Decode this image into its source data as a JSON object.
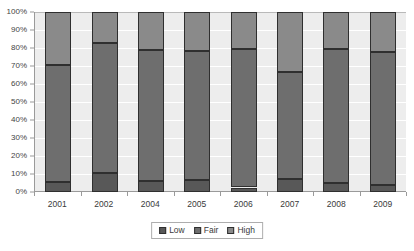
{
  "header": {
    "faint_text": "",
    "page_marker": ""
  },
  "chart_data": {
    "type": "bar",
    "subtype": "stacked-percent-column",
    "title": "",
    "xlabel": "",
    "ylabel": "",
    "categories": [
      "2001",
      "2002",
      "2004",
      "2005",
      "2006",
      "2007",
      "2008",
      "2009"
    ],
    "series": [
      {
        "name": "Low",
        "color": "#585858",
        "values": [
          5.3,
          10.5,
          6.3,
          6.5,
          2.5,
          7.0,
          4.8,
          4.0
        ]
      },
      {
        "name": "Fair",
        "color": "#6e6e6e",
        "values": [
          65.4,
          72.5,
          72.5,
          72.0,
          77.0,
          59.8,
          74.7,
          74.0
        ]
      },
      {
        "name": "High",
        "color": "#8a8a8a",
        "values": [
          29.3,
          17.0,
          21.2,
          21.5,
          20.5,
          33.2,
          20.5,
          22.0
        ]
      }
    ],
    "cumulative_tops": {
      "low": [
        5.3,
        10.5,
        6.3,
        6.5,
        2.5,
        7.0,
        4.8,
        4.0
      ],
      "fair": [
        70.7,
        83.0,
        78.8,
        78.5,
        79.5,
        66.8,
        79.5,
        78.0
      ],
      "high": [
        100,
        100,
        100,
        100,
        100,
        100,
        100,
        100
      ]
    },
    "ylim": [
      0,
      100
    ],
    "y_ticks": [
      "0%",
      "10%",
      "20%",
      "30%",
      "40%",
      "50%",
      "60%",
      "70%",
      "80%",
      "90%",
      "100%"
    ],
    "y_tick_values": [
      0,
      10,
      20,
      30,
      40,
      50,
      60,
      70,
      80,
      90,
      100
    ],
    "grid": true,
    "legend": {
      "position": "bottom",
      "entries": [
        {
          "label": "Low",
          "color": "#585858"
        },
        {
          "label": "Fair",
          "color": "#6e6e6e"
        },
        {
          "label": "High",
          "color": "#8a8a8a"
        }
      ]
    },
    "plot_background": "#ededed",
    "gridline_color": "#ffffff",
    "axis_color": "#9a9a9a"
  }
}
